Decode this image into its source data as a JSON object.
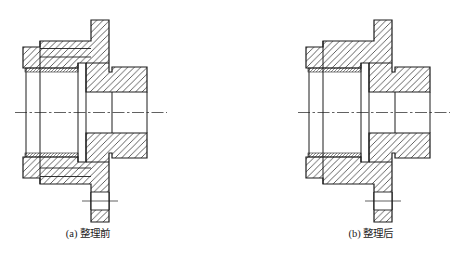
{
  "page": {
    "background": "#ffffff"
  },
  "figures": [
    {
      "id": "a",
      "caption": "(a) 整理前",
      "offset_x": 0,
      "extra_lines": [
        [
          40,
          48.5,
          91,
          48.5
        ],
        [
          40,
          57,
          91,
          57
        ],
        [
          40,
          168,
          91,
          168
        ],
        [
          40,
          176.5,
          91,
          176.5
        ]
      ]
    },
    {
      "id": "b",
      "caption": "(b) 整理后",
      "offset_x": 283,
      "extra_lines": []
    }
  ],
  "geometry": {
    "stroke_color": "#1c1c1c",
    "caption_color": "#222222",
    "caption_x": 88,
    "caption_y": 237,
    "outline_upper": [
      [
        23,
        47
      ],
      [
        40,
        47
      ],
      [
        40,
        41
      ],
      [
        91,
        41
      ],
      [
        91,
        20
      ],
      [
        109,
        20
      ],
      [
        109,
        72
      ],
      [
        112,
        72
      ],
      [
        112,
        67
      ],
      [
        147,
        67
      ],
      [
        147,
        92
      ],
      [
        86,
        92
      ],
      [
        86,
        63
      ],
      [
        78,
        63
      ],
      [
        78,
        68
      ],
      [
        25,
        68
      ],
      [
        23,
        68
      ]
    ],
    "outline_lower": [
      [
        23,
        178
      ],
      [
        23,
        157
      ],
      [
        25,
        157
      ],
      [
        78,
        157
      ],
      [
        78,
        162
      ],
      [
        86,
        162
      ],
      [
        86,
        133
      ],
      [
        147,
        133
      ],
      [
        147,
        158
      ],
      [
        112,
        158
      ],
      [
        112,
        153
      ],
      [
        109,
        153
      ],
      [
        109,
        222
      ],
      [
        91,
        222
      ],
      [
        91,
        184
      ],
      [
        40,
        184
      ],
      [
        40,
        178
      ]
    ],
    "thread_strips": [
      [
        25,
        68,
        78,
        72
      ],
      [
        25,
        153,
        78,
        157
      ]
    ],
    "bolt_hole": {
      "x1": 91,
      "y1": 192,
      "x2": 109,
      "y2": 210
    },
    "hole_centerline": [
      82,
      201,
      118,
      201
    ],
    "centerline": [
      15,
      112.5,
      167,
      112.5
    ],
    "interior_lines": [
      [
        26,
        68,
        26,
        157
      ],
      [
        40,
        41,
        40,
        184
      ],
      [
        78,
        63,
        78,
        162
      ],
      [
        86,
        63,
        86,
        162
      ],
      [
        112,
        92,
        112,
        133
      ],
      [
        147,
        92,
        147,
        133
      ],
      [
        86,
        63,
        109,
        63
      ],
      [
        86,
        162,
        109,
        162
      ]
    ]
  }
}
